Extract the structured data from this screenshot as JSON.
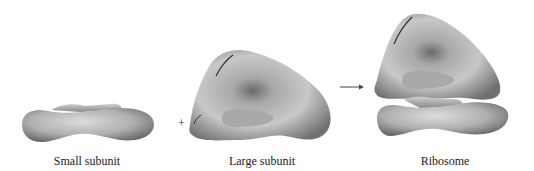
{
  "diagram": {
    "type": "ribosome-assembly",
    "components": [
      {
        "id": "small",
        "label": "Small subunit"
      },
      {
        "id": "large",
        "label": "Large subunit"
      },
      {
        "id": "ribosome",
        "label": "Ribosome"
      }
    ],
    "operators": {
      "plus": "+",
      "arrow": "→"
    },
    "colors": {
      "shape_light": "#d4d4d4",
      "shape_dark": "#6e6e6e",
      "text": "#222222"
    }
  }
}
